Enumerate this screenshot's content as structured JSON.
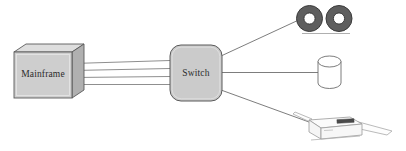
{
  "diagram": {
    "type": "network-topology",
    "background_color": "#ffffff",
    "nodes": [
      {
        "id": "mainframe",
        "label": "Mainframe",
        "shape": "3d-box",
        "fill_color": "#cccccc",
        "top_face_color": "#dcdcdc",
        "side_face_color": "#b4b4b4",
        "stroke_color": "#555555"
      },
      {
        "id": "switch",
        "label": "Switch",
        "shape": "rounded-rectangle",
        "fill_color": "#cbcbcb",
        "stroke_color": "#5a5a5a"
      },
      {
        "id": "tape-drive",
        "label": "",
        "shape": "tape-reels",
        "fill_color": "#5e5e5e",
        "hub_color": "#ffffff",
        "stroke_color": "#3c3c3c"
      },
      {
        "id": "disk-storage",
        "label": "",
        "shape": "cylinder",
        "fill_color": "#ffffff",
        "stroke_color": "#6e6e6e"
      },
      {
        "id": "printer",
        "label": "",
        "shape": "printer",
        "fill_color": "#fbfbfb",
        "stroke_color": "#9a9a9a",
        "panel_color": "#4a4a4a"
      }
    ],
    "links": [
      {
        "id": "mainframe-switch-bus",
        "from": "mainframe",
        "to": "switch",
        "line_count": 4,
        "style": "parallel-bus",
        "color": "#8c8c8c"
      },
      {
        "id": "switch-tape-drive",
        "from": "switch",
        "to": "tape-drive",
        "line_count": 1,
        "style": "straight",
        "color": "#6b6b6b"
      },
      {
        "id": "switch-disk-storage",
        "from": "switch",
        "to": "disk-storage",
        "line_count": 1,
        "style": "straight",
        "color": "#6b6b6b"
      },
      {
        "id": "switch-printer",
        "from": "switch",
        "to": "printer",
        "line_count": 1,
        "style": "straight",
        "color": "#6b6b6b"
      }
    ]
  }
}
